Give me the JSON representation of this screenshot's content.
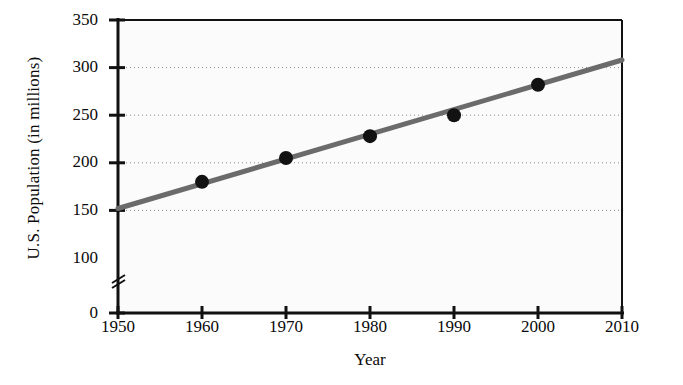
{
  "chart_data": {
    "type": "line",
    "title": "",
    "subtitle": "",
    "xlabel": "Year",
    "ylabel": "U.S. Population (in millions)",
    "xlim": [
      1950,
      2010
    ],
    "ylim": [
      0,
      350
    ],
    "y_axis_break": true,
    "y_break_between": [
      0,
      100
    ],
    "grid": true,
    "grid_style": "dotted-horizontal",
    "legend": "none",
    "xticks": [
      1950,
      1960,
      1970,
      1980,
      1990,
      2000,
      2010
    ],
    "xtick_labels": [
      "1950",
      "1960",
      "1970",
      "1980",
      "1990",
      "2000",
      "2010"
    ],
    "yticks": [
      0,
      100,
      150,
      200,
      250,
      300,
      350
    ],
    "ytick_labels": [
      "0",
      "100",
      "150",
      "200",
      "250",
      "300",
      "350"
    ],
    "series": [
      {
        "name": "U.S. Population trend line",
        "type": "line",
        "color": "#6b6b6b",
        "x": [
          1950,
          2010
        ],
        "values": [
          152,
          308
        ]
      },
      {
        "name": "U.S. Population data points",
        "type": "scatter",
        "color": "#121212",
        "x": [
          1960,
          1970,
          1980,
          1990,
          2000
        ],
        "values": [
          180,
          205,
          228,
          250,
          282
        ]
      }
    ],
    "points": [
      {
        "year": 1960,
        "population": 180
      },
      {
        "year": 1970,
        "population": 205
      },
      {
        "year": 1980,
        "population": 228
      },
      {
        "year": 1990,
        "population": 250
      },
      {
        "year": 2000,
        "population": 282
      }
    ],
    "colors": {
      "line": "#6b6b6b",
      "marker": "#121212",
      "axis": "#111111",
      "grid": "#8a8a8a",
      "plot_background": "#fbfbfb",
      "page_background": "#ffffff",
      "text": "#0b0b0b"
    }
  }
}
